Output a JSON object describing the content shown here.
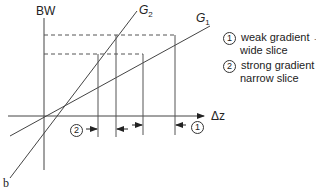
{
  "diagram": {
    "axis_y_label": "BW",
    "axis_x_label": "Δz",
    "lines": [
      {
        "id": "G2",
        "label_main": "G",
        "label_sub": "2"
      },
      {
        "id": "G1",
        "label_main": "G",
        "label_sub": "1"
      }
    ],
    "legend": [
      {
        "marker": "1",
        "line1": "weak gradient →",
        "line2": "wide slice"
      },
      {
        "marker": "2",
        "line1": "strong gradient →",
        "line2": "narrow slice"
      }
    ],
    "slice_markers": [
      {
        "marker": "2",
        "description": "narrow slice width"
      },
      {
        "marker": "1",
        "description": "wide slice width"
      }
    ],
    "panel_label": "b"
  }
}
